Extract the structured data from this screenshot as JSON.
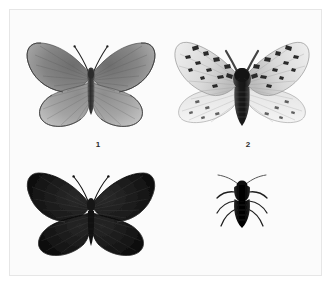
{
  "plate": {
    "background_color": "#fbfbfb",
    "frame_color": "#b9b9b9",
    "width": 334,
    "height": 287
  },
  "captions": [
    {
      "id": "caption-1",
      "text": "1",
      "x": 76,
      "y": 139
    },
    {
      "id": "caption-2",
      "text": "2",
      "x": 226,
      "y": 139
    }
  ],
  "specimens": [
    {
      "id": "specimen-1",
      "name": "butterfly-gray-upper-left",
      "label": "1",
      "kind": "butterfly",
      "wing_color": "#8e8e8e",
      "wing_shade_dark": "#5a5a5a",
      "wing_shade_light": "#b4b4b4",
      "body_color": "#3a3a3a",
      "position": {
        "x": 22,
        "y": 28,
        "width": 136,
        "height": 108
      }
    },
    {
      "id": "specimen-2",
      "name": "moth-mottled-upper-right",
      "label": "2",
      "kind": "moth",
      "wing_color": "#dcdcdc",
      "wing_shade_dark": "#2e2e2e",
      "wing_shade_light": "#f2f2f2",
      "body_color": "#262626",
      "position": {
        "x": 168,
        "y": 28,
        "width": 146,
        "height": 110
      }
    },
    {
      "id": "specimen-3",
      "name": "butterfly-dark-lower-left",
      "label": "",
      "kind": "butterfly",
      "wing_color": "#1d1d1d",
      "wing_shade_dark": "#0b0b0b",
      "wing_shade_light": "#4a4a4a",
      "body_color": "#121212",
      "position": {
        "x": 22,
        "y": 158,
        "width": 136,
        "height": 104
      }
    },
    {
      "id": "specimen-4",
      "name": "insect-body-lower-right",
      "label": "",
      "kind": "insect-body",
      "wing_color": "#0d0d0d",
      "wing_shade_dark": "#000000",
      "wing_shade_light": "#3a3a3a",
      "body_color": "#0d0d0d",
      "position": {
        "x": 206,
        "y": 170,
        "width": 70,
        "height": 70
      }
    }
  ]
}
